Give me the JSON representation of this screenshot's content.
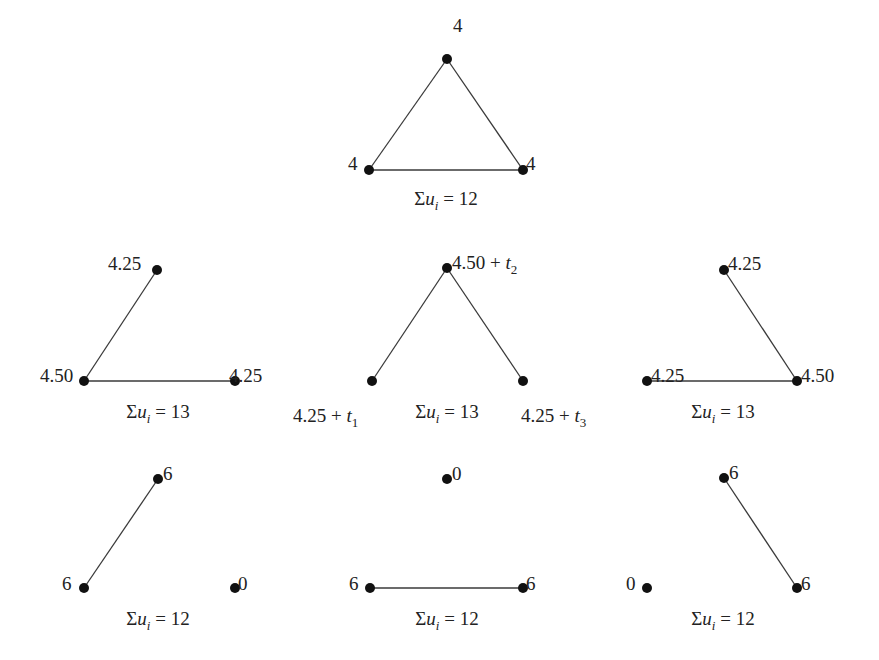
{
  "title": "",
  "graphs": [
    {
      "id": "complete-graph",
      "nodes": [
        {
          "x": 447,
          "y": 59,
          "label": "4",
          "lx": 453,
          "ly": 20,
          "anchor": "start"
        },
        {
          "x": 369,
          "y": 170,
          "label": "4",
          "lx": 348,
          "ly": 158,
          "anchor": "start"
        },
        {
          "x": 523,
          "y": 170,
          "label": "4",
          "lx": 526,
          "ly": 158,
          "anchor": "start"
        }
      ],
      "edges": [
        [
          0,
          1
        ],
        [
          0,
          2
        ],
        [
          1,
          2
        ]
      ],
      "caption": {
        "sigma": "Σ",
        "var": "u",
        "sub": "i",
        "rest": " = 12",
        "x": 446,
        "y": 199
      }
    },
    {
      "id": "two-edge-graph-left",
      "nodes": [
        {
          "x": 157,
          "y": 270,
          "label": "4.25",
          "lx": 108,
          "ly": 258,
          "anchor": "start"
        },
        {
          "x": 84,
          "y": 381,
          "label": "4.50",
          "lx": 40,
          "ly": 370,
          "anchor": "start"
        },
        {
          "x": 235,
          "y": 381,
          "label": "4.25",
          "lx": 229,
          "ly": 370,
          "anchor": "start"
        }
      ],
      "edges": [
        [
          1,
          0
        ],
        [
          1,
          2
        ]
      ],
      "caption": {
        "sigma": "Σ",
        "var": "u",
        "sub": "i",
        "rest": " = 13",
        "x": 158,
        "y": 412
      }
    },
    {
      "id": "two-edge-graph-center",
      "nodes": [
        {
          "x": 447,
          "y": 268,
          "label": "4.50 + t",
          "labelSub": "2",
          "lx": 452,
          "ly": 257,
          "anchor": "start"
        },
        {
          "x": 372,
          "y": 381,
          "label": "4.25 + t",
          "labelSub": "1",
          "lx": 293,
          "ly": 410,
          "anchor": "start"
        },
        {
          "x": 523,
          "y": 381,
          "label": "4.25 + t",
          "labelSub": "3",
          "lx": 521,
          "ly": 410,
          "anchor": "start"
        }
      ],
      "edges": [
        [
          0,
          1
        ],
        [
          0,
          2
        ]
      ],
      "caption": {
        "sigma": "Σ",
        "var": "u",
        "sub": "i",
        "rest": " = 13",
        "x": 447,
        "y": 412
      }
    },
    {
      "id": "two-edge-graph-right",
      "nodes": [
        {
          "x": 724,
          "y": 270,
          "label": "4.25",
          "lx": 728,
          "ly": 258,
          "anchor": "start"
        },
        {
          "x": 647,
          "y": 381,
          "label": "4.25",
          "lx": 651,
          "ly": 370,
          "anchor": "start"
        },
        {
          "x": 797,
          "y": 381,
          "label": "4.50",
          "lx": 801,
          "ly": 370,
          "anchor": "start"
        }
      ],
      "edges": [
        [
          0,
          2
        ],
        [
          1,
          2
        ]
      ],
      "caption": {
        "sigma": "Σ",
        "var": "u",
        "sub": "i",
        "rest": " = 13",
        "x": 723,
        "y": 412
      }
    },
    {
      "id": "one-edge-graph-left",
      "nodes": [
        {
          "x": 158,
          "y": 479,
          "label": "6",
          "lx": 163,
          "ly": 468,
          "anchor": "start"
        },
        {
          "x": 84,
          "y": 588,
          "label": "6",
          "lx": 62,
          "ly": 578,
          "anchor": "start"
        },
        {
          "x": 235,
          "y": 588,
          "label": "0",
          "lx": 238,
          "ly": 578,
          "anchor": "start"
        }
      ],
      "edges": [
        [
          1,
          0
        ]
      ],
      "caption": {
        "sigma": "Σ",
        "var": "u",
        "sub": "i",
        "rest": " = 12",
        "x": 158,
        "y": 619
      }
    },
    {
      "id": "one-edge-graph-center",
      "nodes": [
        {
          "x": 447,
          "y": 479,
          "label": "0",
          "lx": 452,
          "ly": 468,
          "anchor": "start"
        },
        {
          "x": 370,
          "y": 588,
          "label": "6",
          "lx": 349,
          "ly": 578,
          "anchor": "start"
        },
        {
          "x": 523,
          "y": 588,
          "label": "6",
          "lx": 526,
          "ly": 578,
          "anchor": "start"
        }
      ],
      "edges": [
        [
          1,
          2
        ]
      ],
      "caption": {
        "sigma": "Σ",
        "var": "u",
        "sub": "i",
        "rest": " = 12",
        "x": 447,
        "y": 619
      }
    },
    {
      "id": "one-edge-graph-right",
      "nodes": [
        {
          "x": 724,
          "y": 478,
          "label": "6",
          "lx": 729,
          "ly": 467,
          "anchor": "start"
        },
        {
          "x": 647,
          "y": 588,
          "label": "0",
          "lx": 626,
          "ly": 578,
          "anchor": "start"
        },
        {
          "x": 797,
          "y": 588,
          "label": "6",
          "lx": 801,
          "ly": 578,
          "anchor": "start"
        }
      ],
      "edges": [
        [
          0,
          2
        ]
      ],
      "caption": {
        "sigma": "Σ",
        "var": "u",
        "sub": "i",
        "rest": " = 12",
        "x": 723,
        "y": 619
      }
    }
  ],
  "style": {
    "node_color": "#111111",
    "edge_color": "#3a3a3a",
    "text_color": "#222222",
    "background": "#ffffff",
    "node_radius": 5
  }
}
